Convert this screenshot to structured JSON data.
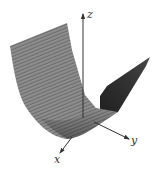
{
  "figure": {
    "colors": {
      "surface_light": "#8c8c8c",
      "surface_stripe": "#6a6a6a",
      "surface_dark": "#2e2e2e",
      "axis": "#333333",
      "background": "#ffffff"
    },
    "axes": {
      "x_label": "x",
      "y_label": "y",
      "z_label": "z"
    }
  }
}
